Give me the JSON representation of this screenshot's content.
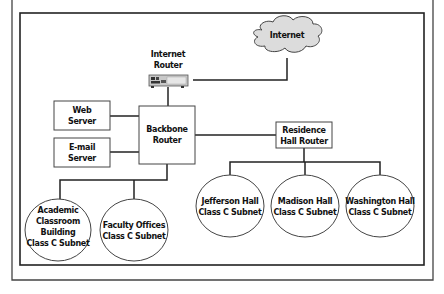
{
  "diagram": {
    "colors": {
      "line": "#222222",
      "frame": "#333333",
      "cloud_fill": "#dddddd",
      "box_fill": "#ffffff",
      "router_body": "#cccccc"
    },
    "nodes": {
      "internet_cloud": {
        "label": "Internet",
        "shape": "cloud"
      },
      "internet_router": {
        "label_line1": "Internet",
        "label_line2": "Router",
        "icon": "router-device-icon"
      },
      "backbone_router": {
        "label_line1": "Backbone",
        "label_line2": "Router",
        "shape": "box"
      },
      "web_server": {
        "label_line1": "Web",
        "label_line2": "Server",
        "shape": "box"
      },
      "email_server": {
        "label_line1": "E-mail",
        "label_line2": "Server",
        "shape": "box"
      },
      "residence_router": {
        "label_line1": "Residence",
        "label_line2": "Hall Router",
        "shape": "box"
      },
      "academic_subnet": {
        "label_line1": "Academic",
        "label_line2": "Classroom",
        "label_line3": "Building",
        "label_line4": "Class C Subnet",
        "shape": "ellipse"
      },
      "faculty_subnet": {
        "label_line1": "Faculty Offices",
        "label_line2": "Class C Subnet",
        "shape": "ellipse"
      },
      "jefferson_subnet": {
        "label_line1": "Jefferson Hall",
        "label_line2": "Class C Subnet",
        "shape": "ellipse"
      },
      "madison_subnet": {
        "label_line1": "Madison Hall",
        "label_line2": "Class C Subnet",
        "shape": "ellipse"
      },
      "washington_subnet": {
        "label_line1": "Washington Hall",
        "label_line2": "Class C Subnet",
        "shape": "ellipse"
      }
    },
    "edges": [
      [
        "internet_router",
        "internet_cloud"
      ],
      [
        "internet_router",
        "backbone_router"
      ],
      [
        "web_server",
        "backbone_router"
      ],
      [
        "email_server",
        "backbone_router"
      ],
      [
        "backbone_router",
        "residence_router"
      ],
      [
        "backbone_router",
        "academic_subnet"
      ],
      [
        "backbone_router",
        "faculty_subnet"
      ],
      [
        "residence_router",
        "jefferson_subnet"
      ],
      [
        "residence_router",
        "madison_subnet"
      ],
      [
        "residence_router",
        "washington_subnet"
      ]
    ]
  }
}
